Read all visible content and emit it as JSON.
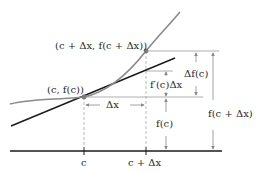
{
  "diagram": {
    "type": "differential-approximation",
    "colors": {
      "curve": "#8a8a8a",
      "tangent": "#1a1a1a",
      "axis": "#1a1a1a",
      "guide": "#9a9a9a",
      "point": "#7a7a7a",
      "text": "#2a2a2a"
    },
    "labels": {
      "point_c": "(c, f(c))",
      "point_c_dx": "(c + Δx, f(c + Δx))",
      "delta_x": "Δx",
      "delta_f": "Δf(c)",
      "fprime_dx": "f′(c)Δx",
      "f_c": "f(c)",
      "f_c_dx": "f(c + Δx)",
      "tick_c": "c",
      "tick_c_dx": "c + Δx"
    }
  }
}
